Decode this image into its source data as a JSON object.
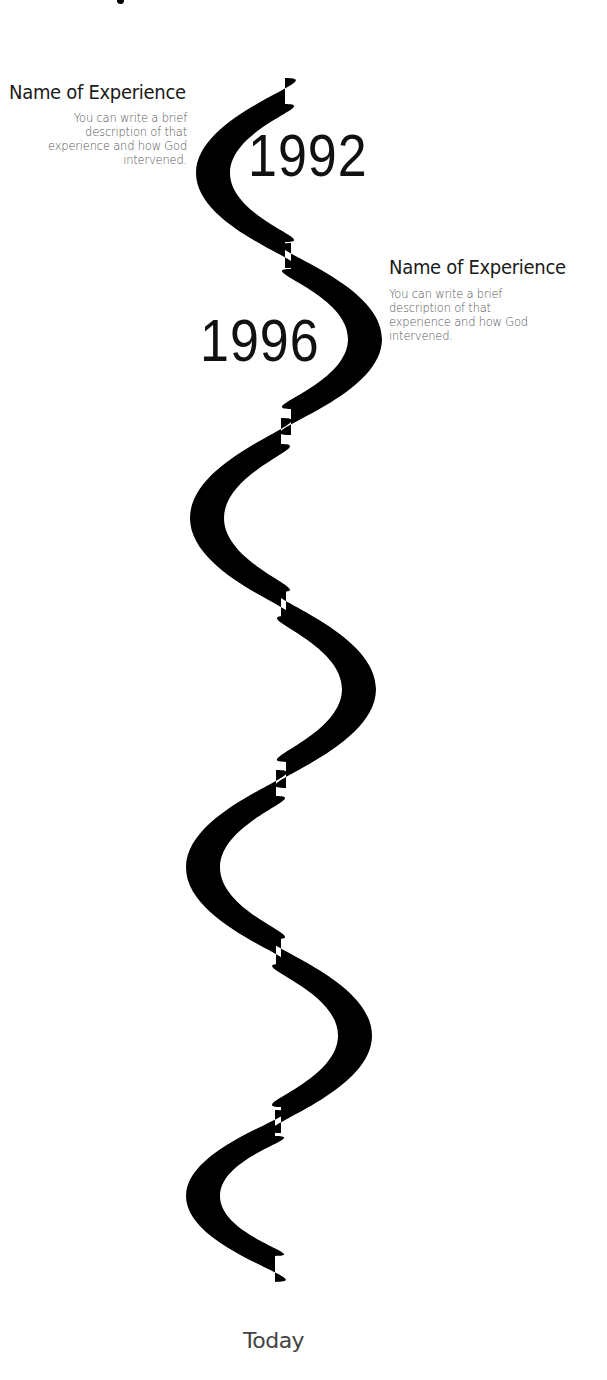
{
  "timeline": {
    "segment_count": 7,
    "color": "#000000",
    "events": [
      {
        "year": "1992",
        "title": "Name of Experience",
        "description_lines": [
          "You can write a brief",
          "description of that",
          "experience and how God",
          "intervened."
        ],
        "side": "left"
      },
      {
        "year": "1996",
        "title": "Name of Experience",
        "description_lines": [
          "You can write a brief",
          "description of that",
          "experience and how God",
          "intervened."
        ],
        "side": "right"
      }
    ],
    "end_label": "Today"
  }
}
